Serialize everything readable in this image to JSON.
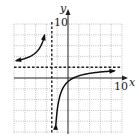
{
  "chart_data": {
    "type": "line",
    "title": "",
    "xlabel": "x",
    "ylabel": "y",
    "xlim": [
      -10,
      10
    ],
    "ylim": [
      -10,
      10
    ],
    "grid": true,
    "grid_step": 2,
    "tick_labels": {
      "x_max": "10",
      "y_max": "10"
    },
    "asymptotes": {
      "vertical": {
        "x": -3,
        "style": "dashed"
      },
      "horizontal": {
        "y": 2,
        "style": "dashed"
      }
    },
    "series": [
      {
        "name": "left branch",
        "function": "f(x) = 2 - 8/(x+3)",
        "x": [
          -10,
          -8,
          -6,
          -5,
          -4.5,
          -4
        ],
        "y": [
          3.1,
          3.6,
          4.7,
          6.0,
          7.3,
          10
        ]
      },
      {
        "name": "right branch",
        "function": "f(x) = 2 - 8/(x+3)",
        "x": [
          -2.2,
          -2,
          -1,
          0,
          1,
          3,
          5,
          7,
          9
        ],
        "y": [
          -8,
          -6,
          -2,
          -0.67,
          0,
          0.67,
          1,
          1.2,
          1.33
        ]
      }
    ]
  },
  "labels": {
    "x_axis": "x",
    "y_axis": "y",
    "x_tick": "10",
    "y_tick": "10"
  }
}
